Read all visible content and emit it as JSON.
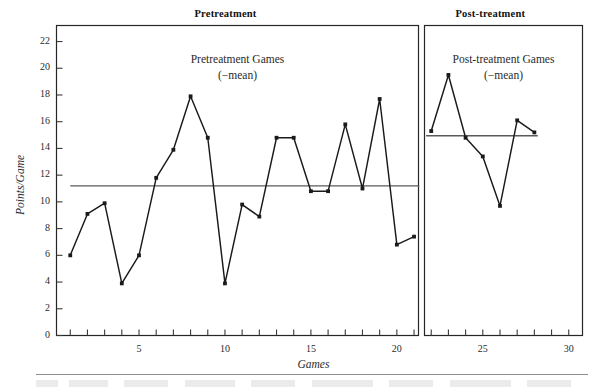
{
  "figure": {
    "headers": [
      {
        "text": "Pretreatment",
        "name": "header-pretreatment"
      },
      {
        "text": "Post-treatment",
        "name": "header-post-treatment"
      }
    ],
    "panel_titles": [
      {
        "line1": "Pretreatment Games",
        "line2": "(−mean)",
        "name": "panel-title-pretreatment"
      },
      {
        "line1": "Post-treatment Games",
        "line2": "(−mean)",
        "name": "panel-title-post-treatment"
      }
    ]
  },
  "chart_data": {
    "type": "line",
    "title": "",
    "xlabel": "Games",
    "ylabel": "Points/Game",
    "xlim": [
      0.2,
      30.8
    ],
    "ylim": [
      0,
      23.2
    ],
    "yticks": [
      0,
      2,
      4,
      6,
      8,
      10,
      12,
      14,
      16,
      18,
      20,
      22
    ],
    "ytick_labels": [
      "0",
      "2",
      "4",
      "6",
      "8",
      "10",
      "12",
      "14",
      "16",
      "18",
      "20",
      "22"
    ],
    "xticks": [
      1,
      2,
      3,
      4,
      5,
      6,
      7,
      8,
      9,
      10,
      11,
      12,
      13,
      14,
      15,
      16,
      17,
      18,
      19,
      20,
      21,
      22,
      23,
      24,
      25,
      26,
      27,
      28,
      29,
      30
    ],
    "xtick_labels_shown": [
      {
        "value": 5,
        "label": "5"
      },
      {
        "value": 10,
        "label": "10"
      },
      {
        "value": 15,
        "label": "15"
      },
      {
        "value": 20,
        "label": "20"
      },
      {
        "value": 25,
        "label": "25"
      },
      {
        "value": 30,
        "label": "30"
      }
    ],
    "grid": false,
    "legend": "none",
    "divider_x": 21.5,
    "series": [
      {
        "name": "Pretreatment Games",
        "marker": "square",
        "color": "#1a1a1a",
        "x": [
          1,
          2,
          3,
          4,
          5,
          6,
          7,
          8,
          9,
          10,
          11,
          12,
          13,
          14,
          15,
          16,
          17,
          18,
          19,
          20,
          21
        ],
        "values": [
          6.0,
          9.1,
          9.9,
          3.9,
          6.0,
          11.8,
          13.9,
          17.9,
          14.8,
          3.9,
          9.8,
          8.9,
          14.8,
          14.8,
          10.8,
          10.8,
          15.8,
          11.0,
          17.7,
          6.8,
          7.4
        ]
      },
      {
        "name": "Post-treatment Games",
        "marker": "square",
        "color": "#1a1a1a",
        "x": [
          22,
          23,
          24,
          25,
          26,
          27,
          28
        ],
        "values": [
          15.3,
          19.5,
          14.8,
          13.4,
          9.7,
          16.1,
          15.2
        ]
      }
    ],
    "mean_lines": [
      {
        "name": "pretreatment-mean",
        "value": 11.2,
        "x_start": 1.0,
        "x_end": 21.3,
        "color": "#5a5a5a"
      },
      {
        "name": "post-treatment-mean",
        "value": 14.95,
        "x_start": 21.7,
        "x_end": 28.2,
        "color": "#5a5a5a"
      }
    ]
  }
}
